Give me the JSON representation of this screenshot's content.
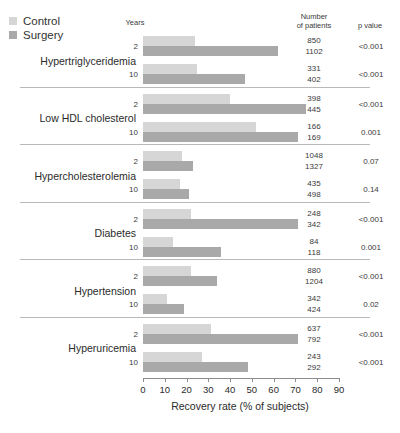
{
  "legend": {
    "items": [
      {
        "label": "Control",
        "color": "#d6d6d6"
      },
      {
        "label": "Surgery",
        "color": "#a9a9a9"
      }
    ]
  },
  "headers": {
    "years": "Years",
    "number_of_patients_line1": "Number",
    "number_of_patients_line2": "of patients",
    "p_value": "p value"
  },
  "axis": {
    "title": "Recovery rate (% of subjects)",
    "ticks": [
      "0",
      "10",
      "20",
      "30",
      "40",
      "50",
      "60",
      "70",
      "80",
      "90"
    ]
  },
  "chart_data": {
    "type": "bar",
    "title": "",
    "xlabel": "Recovery rate (% of subjects)",
    "ylabel": "",
    "xlim": [
      0,
      90
    ],
    "orientation": "horizontal",
    "grid": false,
    "legend_position": "top-left",
    "series_names": [
      "Control",
      "Surgery"
    ],
    "groups": [
      {
        "condition": "Hypertriglyceridemia",
        "rows": [
          {
            "years": "2",
            "control": 24,
            "surgery": 62,
            "n_control": "850",
            "n_surgery": "1102",
            "p": "<0.001"
          },
          {
            "years": "10",
            "control": 25,
            "surgery": 47,
            "n_control": "331",
            "n_surgery": "402",
            "p": "<0.001"
          }
        ]
      },
      {
        "condition": "Low HDL cholesterol",
        "rows": [
          {
            "years": "2",
            "control": 40,
            "surgery": 75,
            "n_control": "398",
            "n_surgery": "445",
            "p": "<0.001"
          },
          {
            "years": "10",
            "control": 52,
            "surgery": 71,
            "n_control": "166",
            "n_surgery": "169",
            "p": "0.001"
          }
        ]
      },
      {
        "condition": "Hypercholesterolemia",
        "rows": [
          {
            "years": "2",
            "control": 18,
            "surgery": 23,
            "n_control": "1048",
            "n_surgery": "1327",
            "p": "0.07"
          },
          {
            "years": "10",
            "control": 17,
            "surgery": 21,
            "n_control": "435",
            "n_surgery": "498",
            "p": "0.14"
          }
        ]
      },
      {
        "condition": "Diabetes",
        "rows": [
          {
            "years": "2",
            "control": 22,
            "surgery": 71,
            "n_control": "248",
            "n_surgery": "342",
            "p": "<0.001"
          },
          {
            "years": "10",
            "control": 14,
            "surgery": 36,
            "n_control": "84",
            "n_surgery": "118",
            "p": "0.001"
          }
        ]
      },
      {
        "condition": "Hypertension",
        "rows": [
          {
            "years": "2",
            "control": 22,
            "surgery": 34,
            "n_control": "880",
            "n_surgery": "1204",
            "p": "<0.001"
          },
          {
            "years": "10",
            "control": 11,
            "surgery": 19,
            "n_control": "342",
            "n_surgery": "424",
            "p": "0.02"
          }
        ]
      },
      {
        "condition": "Hyperuricemia",
        "rows": [
          {
            "years": "2",
            "control": 31,
            "surgery": 71,
            "n_control": "637",
            "n_surgery": "792",
            "p": "<0.001"
          },
          {
            "years": "10",
            "control": 27,
            "surgery": 48,
            "n_control": "243",
            "n_surgery": "292",
            "p": "<0.001"
          }
        ]
      }
    ]
  }
}
